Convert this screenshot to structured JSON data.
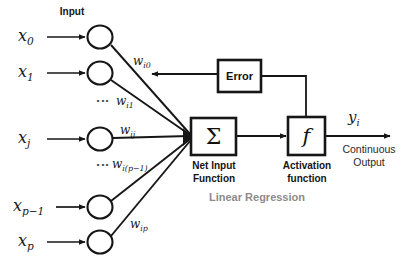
{
  "diagram": {
    "title_input": "Input",
    "subtitle": "Linear Regression",
    "inputs": [
      {
        "label": "x",
        "sub": "0",
        "weight_label": "w",
        "weight_sub": "i0"
      },
      {
        "label": "x",
        "sub": "1",
        "weight_label": "w",
        "weight_sub": "i1"
      },
      {
        "label": "x",
        "sub": "j",
        "weight_label": "w",
        "weight_sub": "ij"
      },
      {
        "label": "x",
        "sub": "p−1",
        "weight_label": "w",
        "weight_sub": "i(p−1)"
      },
      {
        "label": "x",
        "sub": "p",
        "weight_label": "w",
        "weight_sub": "ip"
      }
    ],
    "ellipsis_glyph": "⋮",
    "nodes": {
      "net_input": {
        "glyph": "Σ",
        "caption_line1": "Net Input",
        "caption_line2": "Function"
      },
      "activation": {
        "glyph": "f",
        "caption_line1": "Activation",
        "caption_line2": "function"
      },
      "error": {
        "label": "Error"
      }
    },
    "output": {
      "label": "y",
      "sub": "i",
      "caption_line1": "Continuous",
      "caption_line2": "Output"
    },
    "colors": {
      "stroke": "#161616",
      "subtitle_gray": "#8c8c8c",
      "background": "#ffffff"
    }
  }
}
